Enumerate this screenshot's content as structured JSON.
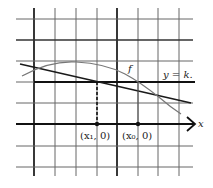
{
  "figure": {
    "labels": {
      "curve": "f",
      "level_line": "y = k.",
      "x_axis": "x",
      "point1": "(x₁, 0)",
      "point0": "(x₀, 0)"
    },
    "grid": {
      "vertical_x": [
        34,
        55,
        76,
        97,
        117,
        138,
        158,
        179
      ],
      "horizontal_y": [
        19,
        40,
        61,
        82,
        103,
        124,
        146,
        167
      ],
      "thick_vertical": [
        34,
        117
      ],
      "thick_horizontal": [
        40,
        82,
        124
      ]
    },
    "colors": {
      "grid": "#555555",
      "ink": "#1a1a1a",
      "curve": "#777777"
    }
  }
}
